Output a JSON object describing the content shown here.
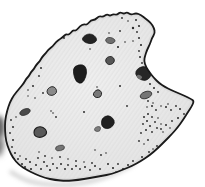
{
  "illustration": {
    "subject": "speckled-rock-flake-sketch",
    "canvas": {
      "width": 205,
      "height": 187,
      "background": "#ffffff"
    },
    "palette": {
      "outline": "#1a1a1a",
      "fill_center": "#efefef",
      "fill_edge": "#e1e1e1",
      "hatch": "#d9d9d9",
      "stipple": "#2b2b2b",
      "spot_dark": "#1f1f1f",
      "spot_gray": "#777777",
      "shadow": "#a6a6a6",
      "smudge": "#383838"
    },
    "outline": [
      [
        127,
        12
      ],
      [
        131,
        15
      ],
      [
        136,
        13
      ],
      [
        141,
        15
      ],
      [
        146,
        19
      ],
      [
        151,
        23
      ],
      [
        154,
        28
      ],
      [
        155,
        33
      ],
      [
        152,
        38
      ],
      [
        150,
        44
      ],
      [
        147,
        50
      ],
      [
        145,
        56
      ],
      [
        144,
        61
      ],
      [
        146,
        67
      ],
      [
        150,
        73
      ],
      [
        154,
        78
      ],
      [
        159,
        83
      ],
      [
        165,
        87
      ],
      [
        171,
        90
      ],
      [
        178,
        93
      ],
      [
        185,
        96
      ],
      [
        191,
        99
      ],
      [
        194,
        101
      ],
      [
        192,
        106
      ],
      [
        188,
        112
      ],
      [
        183,
        120
      ],
      [
        178,
        127
      ],
      [
        172,
        134
      ],
      [
        165,
        141
      ],
      [
        158,
        148
      ],
      [
        150,
        155
      ],
      [
        141,
        161
      ],
      [
        132,
        166
      ],
      [
        122,
        170
      ],
      [
        112,
        174
      ],
      [
        101,
        176
      ],
      [
        90,
        178
      ],
      [
        78,
        180
      ],
      [
        66,
        181
      ],
      [
        55,
        180
      ],
      [
        45,
        178
      ],
      [
        35,
        174
      ],
      [
        27,
        170
      ],
      [
        19,
        165
      ],
      [
        13,
        158
      ],
      [
        9,
        150
      ],
      [
        6,
        141
      ],
      [
        5,
        131
      ],
      [
        5,
        121
      ],
      [
        7,
        111
      ],
      [
        10,
        102
      ],
      [
        14,
        95
      ],
      [
        19,
        89
      ],
      [
        24,
        83
      ],
      [
        26,
        79
      ],
      [
        29,
        76
      ],
      [
        31,
        72
      ],
      [
        34,
        69
      ],
      [
        36,
        65
      ],
      [
        40,
        61
      ],
      [
        42,
        57
      ],
      [
        46,
        53
      ],
      [
        48,
        50
      ],
      [
        53,
        46
      ],
      [
        56,
        42
      ],
      [
        60,
        39
      ],
      [
        63,
        37
      ],
      [
        66,
        34
      ],
      [
        69,
        35
      ],
      [
        73,
        30
      ],
      [
        76,
        31
      ],
      [
        80,
        26
      ],
      [
        84,
        24
      ],
      [
        87,
        25
      ],
      [
        91,
        20
      ],
      [
        95,
        20
      ],
      [
        99,
        16
      ],
      [
        103,
        17
      ],
      [
        107,
        14
      ],
      [
        110,
        16
      ],
      [
        113,
        14
      ],
      [
        117,
        15
      ],
      [
        120,
        12
      ],
      [
        124,
        14
      ]
    ],
    "outline_stroke_width": 1.8,
    "spots": [
      {
        "name": "inclusion-1",
        "type": "polygon",
        "points": [
          [
            83,
            37
          ],
          [
            87,
            34
          ],
          [
            92,
            34
          ],
          [
            96,
            37
          ],
          [
            97,
            41
          ],
          [
            92,
            44
          ],
          [
            86,
            43
          ],
          [
            82,
            40
          ]
        ],
        "fill": "#232323",
        "stroke": "#121212",
        "sw": 0.7
      },
      {
        "name": "inclusion-2",
        "type": "polygon",
        "points": [
          [
            105,
            40
          ],
          [
            108,
            37
          ],
          [
            113,
            38
          ],
          [
            116,
            41
          ],
          [
            112,
            44
          ],
          [
            107,
            43
          ]
        ],
        "fill": "#6f6f6f",
        "stroke": "#383838",
        "sw": 0.8
      },
      {
        "name": "inclusion-3",
        "type": "polygon",
        "points": [
          [
            74,
            66
          ],
          [
            83,
            64
          ],
          [
            87,
            69
          ],
          [
            86,
            77
          ],
          [
            82,
            84
          ],
          [
            76,
            82
          ],
          [
            73,
            73
          ]
        ],
        "fill": "#1d1d1d",
        "stroke": "#101010",
        "sw": 0.7
      },
      {
        "name": "inclusion-4",
        "type": "polygon",
        "points": [
          [
            107,
            57
          ],
          [
            112,
            56
          ],
          [
            115,
            60
          ],
          [
            113,
            64
          ],
          [
            108,
            65
          ],
          [
            105,
            61
          ]
        ],
        "fill": "#565656",
        "stroke": "#222222",
        "sw": 0.9
      },
      {
        "name": "inclusion-5",
        "type": "polygon",
        "points": [
          [
            137,
            69
          ],
          [
            143,
            66
          ],
          [
            149,
            68
          ],
          [
            152,
            72
          ],
          [
            150,
            78
          ],
          [
            145,
            81
          ],
          [
            139,
            79
          ],
          [
            135,
            74
          ]
        ],
        "fill": "#262626",
        "stroke": "#141414",
        "sw": 0.7
      },
      {
        "name": "inclusion-5-highlight",
        "type": "polygon",
        "points": [
          [
            138,
            74
          ],
          [
            143,
            77
          ],
          [
            140,
            80
          ],
          [
            136,
            77
          ]
        ],
        "fill": "#6f6f6f",
        "stroke": "none",
        "sw": 0
      },
      {
        "name": "inclusion-6",
        "type": "polygon",
        "points": [
          [
            47,
            89
          ],
          [
            52,
            86
          ],
          [
            56,
            88
          ],
          [
            57,
            93
          ],
          [
            52,
            96
          ],
          [
            47,
            94
          ]
        ],
        "fill": "#8a8a8a",
        "stroke": "#2d2d2d",
        "sw": 1
      },
      {
        "name": "inclusion-7",
        "type": "polygon",
        "points": [
          [
            94,
            92
          ],
          [
            98,
            89
          ],
          [
            102,
            92
          ],
          [
            101,
            97
          ],
          [
            96,
            98
          ],
          [
            93,
            95
          ]
        ],
        "fill": "#787878",
        "stroke": "#242424",
        "sw": 1
      },
      {
        "name": "inclusion-8",
        "type": "ellipse",
        "cx": 146,
        "cy": 95,
        "rx": 6,
        "ry": 3.4,
        "rotate": -20,
        "fill": "#757575",
        "stroke": "#383838",
        "sw": 0.9
      },
      {
        "name": "inclusion-9",
        "type": "ellipse",
        "cx": 25,
        "cy": 112,
        "rx": 5.5,
        "ry": 3,
        "rotate": -22,
        "fill": "#4a4a4a",
        "stroke": "#2a2a2a",
        "sw": 0.7
      },
      {
        "name": "inclusion-10",
        "type": "polygon",
        "points": [
          [
            102,
            118
          ],
          [
            108,
            115
          ],
          [
            113,
            118
          ],
          [
            115,
            123
          ],
          [
            111,
            128
          ],
          [
            105,
            129
          ],
          [
            101,
            125
          ]
        ],
        "fill": "#202020",
        "stroke": "#101010",
        "sw": 0.7
      },
      {
        "name": "inclusion-10b",
        "type": "polygon",
        "points": [
          [
            95,
            127
          ],
          [
            101,
            126
          ],
          [
            100,
            132
          ],
          [
            94,
            131
          ]
        ],
        "fill": "#7d7d7d",
        "stroke": "#3a3a3a",
        "sw": 0.6
      },
      {
        "name": "inclusion-11",
        "type": "polygon",
        "points": [
          [
            34,
            129
          ],
          [
            40,
            126
          ],
          [
            46,
            129
          ],
          [
            47,
            134
          ],
          [
            41,
            138
          ],
          [
            34,
            136
          ]
        ],
        "fill": "#5a5a5a",
        "stroke": "#1e1e1e",
        "sw": 1.1
      },
      {
        "name": "inclusion-12",
        "type": "ellipse",
        "cx": 60,
        "cy": 148,
        "rx": 4.6,
        "ry": 2.7,
        "rotate": -14,
        "fill": "#757575",
        "stroke": "#3d3d3d",
        "sw": 0.7
      }
    ],
    "stipple_dots": [
      [
        136,
        20,
        1
      ],
      [
        139,
        26,
        1.1
      ],
      [
        137,
        32,
        0.9
      ],
      [
        139,
        38,
        1
      ],
      [
        141,
        45,
        1.1
      ],
      [
        139,
        51,
        0.9
      ],
      [
        140,
        57,
        1
      ],
      [
        142,
        63,
        0.9
      ],
      [
        133,
        28,
        1.2
      ],
      [
        125,
        42,
        0.8
      ],
      [
        120,
        31,
        0.9
      ],
      [
        109,
        33,
        0.8
      ],
      [
        122,
        18,
        0.9
      ],
      [
        128,
        21,
        0.8
      ],
      [
        90,
        49,
        0.8
      ],
      [
        118,
        47,
        1.1
      ],
      [
        133,
        41,
        0.8
      ],
      [
        64,
        38,
        0.9
      ],
      [
        150,
        84,
        1
      ],
      [
        154,
        88,
        1
      ],
      [
        158,
        92,
        0.9
      ],
      [
        148,
        101,
        0.9
      ],
      [
        152,
        106,
        1
      ],
      [
        147,
        107,
        0.8
      ],
      [
        156,
        110,
        0.9
      ],
      [
        161,
        106,
        0.8
      ],
      [
        166,
        107,
        1
      ],
      [
        171,
        110,
        0.9
      ],
      [
        176,
        106,
        0.9
      ],
      [
        180,
        109,
        1
      ],
      [
        184,
        114,
        0.9
      ],
      [
        178,
        118,
        1
      ],
      [
        172,
        121,
        0.9
      ],
      [
        166,
        125,
        1
      ],
      [
        161,
        129,
        0.9
      ],
      [
        170,
        128,
        0.8
      ],
      [
        168,
        104,
        0.8
      ],
      [
        153,
        103,
        0.8
      ],
      [
        144,
        117,
        1
      ],
      [
        148,
        114,
        1
      ],
      [
        152,
        117,
        0.9
      ],
      [
        147,
        121,
        1
      ],
      [
        143,
        124,
        0.9
      ],
      [
        150,
        126,
        1
      ],
      [
        155,
        122,
        0.9
      ],
      [
        158,
        118,
        0.8
      ],
      [
        146,
        130,
        1
      ],
      [
        152,
        132,
        0.9
      ],
      [
        157,
        128,
        0.9
      ],
      [
        161,
        124,
        0.8
      ],
      [
        141,
        133,
        0.9
      ],
      [
        163,
        132,
        0.8
      ],
      [
        108,
        164,
        1
      ],
      [
        113,
        168,
        1.1
      ],
      [
        118,
        164,
        0.9
      ],
      [
        123,
        169,
        1
      ],
      [
        128,
        165,
        1
      ],
      [
        133,
        161,
        0.9
      ],
      [
        137,
        164,
        1
      ],
      [
        142,
        157,
        1
      ],
      [
        147,
        159,
        0.9
      ],
      [
        149,
        152,
        0.9
      ],
      [
        153,
        149,
        0.8
      ],
      [
        157,
        146,
        0.9
      ],
      [
        116,
        172,
        0.8
      ],
      [
        126,
        171,
        0.9
      ],
      [
        135,
        168,
        0.8
      ],
      [
        139,
        141,
        0.9
      ],
      [
        144,
        144,
        0.8
      ],
      [
        148,
        140,
        0.9
      ],
      [
        18,
        159,
        1
      ],
      [
        22,
        164,
        1
      ],
      [
        26,
        159,
        0.9
      ],
      [
        25,
        167,
        1
      ],
      [
        30,
        162,
        1
      ],
      [
        31,
        169,
        1.1
      ],
      [
        36,
        165,
        1
      ],
      [
        38,
        158,
        0.9
      ],
      [
        41,
        169,
        1
      ],
      [
        44,
        162,
        1
      ],
      [
        47,
        166,
        0.9
      ],
      [
        50,
        170,
        1.1
      ],
      [
        53,
        164,
        1
      ],
      [
        57,
        168,
        0.9
      ],
      [
        61,
        164,
        1
      ],
      [
        65,
        169,
        1
      ],
      [
        68,
        165,
        0.9
      ],
      [
        72,
        169,
        1
      ],
      [
        76,
        166,
        1
      ],
      [
        80,
        169,
        0.9
      ],
      [
        85,
        167,
        1
      ],
      [
        90,
        170,
        0.9
      ],
      [
        95,
        166,
        1
      ],
      [
        100,
        169,
        0.9
      ],
      [
        45,
        156,
        0.9
      ],
      [
        52,
        158,
        0.8
      ],
      [
        60,
        157,
        0.9
      ],
      [
        68,
        159,
        0.8
      ],
      [
        76,
        161,
        0.9
      ],
      [
        84,
        162,
        0.8
      ],
      [
        92,
        163,
        0.9
      ],
      [
        39,
        152,
        0.8
      ],
      [
        95,
        150,
        0.8
      ],
      [
        101,
        155,
        0.9
      ],
      [
        106,
        153,
        0.8
      ],
      [
        11,
        120,
        0.9
      ],
      [
        13,
        127,
        1
      ],
      [
        10,
        133,
        0.9
      ],
      [
        13,
        140,
        1
      ],
      [
        12,
        147,
        0.9
      ],
      [
        15,
        153,
        1
      ],
      [
        14,
        159,
        0.9
      ],
      [
        17,
        163,
        1
      ],
      [
        20,
        156,
        0.8
      ],
      [
        16,
        117,
        0.8
      ],
      [
        41,
        68,
        1
      ],
      [
        39,
        76,
        0.9
      ],
      [
        33,
        86,
        1
      ],
      [
        43,
        93,
        0.9
      ],
      [
        28,
        90,
        0.8
      ],
      [
        35,
        98,
        0.8
      ],
      [
        28,
        96,
        0.7
      ],
      [
        120,
        86,
        1
      ],
      [
        127,
        106,
        0.9
      ],
      [
        97,
        87,
        0.8
      ],
      [
        84,
        112,
        1
      ],
      [
        53,
        113,
        0.8
      ],
      [
        51,
        111,
        0.8
      ],
      [
        56,
        117,
        0.9
      ]
    ],
    "shadow_path": [
      [
        11,
        172
      ],
      [
        22,
        179
      ],
      [
        36,
        183
      ],
      [
        52,
        185
      ],
      [
        70,
        185
      ],
      [
        88,
        182
      ],
      [
        104,
        178
      ],
      [
        118,
        172
      ],
      [
        130,
        166
      ],
      [
        139,
        160
      ]
    ],
    "shadow": {
      "width": 3.5,
      "opacity": 0.55
    },
    "smudges": [
      {
        "cx": -1,
        "cy": 127,
        "rx": 5.5,
        "ry": 11,
        "fill": "#2e2e2e",
        "opacity": 0.9
      },
      {
        "cx": -2,
        "cy": 146,
        "rx": 5,
        "ry": 9,
        "fill": "#4f4f4f",
        "opacity": 0.8
      },
      {
        "cx": -1,
        "cy": 136,
        "rx": 7,
        "ry": 22,
        "fill": "#8c8c8c",
        "opacity": 0.45
      }
    ]
  }
}
